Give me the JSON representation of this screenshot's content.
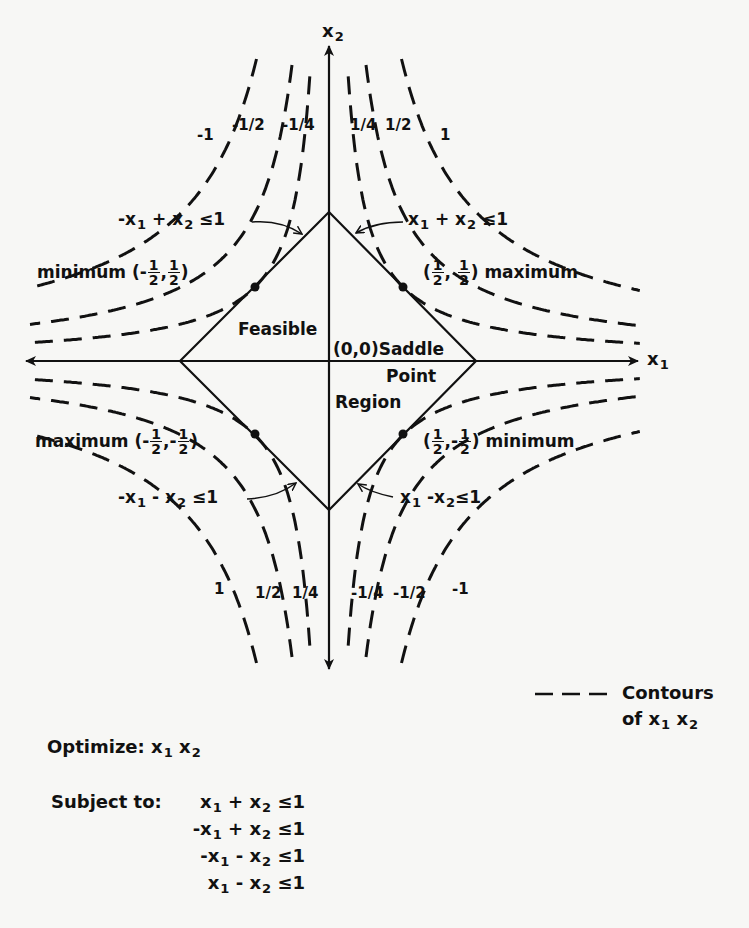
{
  "axes": {
    "x_label": "x",
    "x_label_sub": "1",
    "y_label": "x",
    "y_label_sub": "2"
  },
  "region": {
    "label_line1": "Feasible",
    "label_line2": "Region",
    "saddle_label": "(0,0)",
    "saddle_text1": "Saddle",
    "saddle_text2": "Point"
  },
  "constraints_on_plot": [
    {
      "id": "c_nw",
      "text": "-x",
      "sub1": "1",
      "mid": " + x",
      "sub2": "2",
      "rhs": " ≤1"
    },
    {
      "id": "c_ne",
      "text": "x",
      "sub1": "1",
      "mid": " + x",
      "sub2": "2",
      "rhs": " ≤1"
    },
    {
      "id": "c_sw",
      "text": "-x",
      "sub1": "1",
      "mid": " - x",
      "sub2": "2",
      "rhs": " ≤1"
    },
    {
      "id": "c_se",
      "text": "x",
      "sub1": "1",
      "mid": " -x",
      "sub2": "2",
      "rhs": "≤1"
    }
  ],
  "extrema": [
    {
      "id": "nw",
      "type": "minimum",
      "x_sign": "-",
      "x_num": "1",
      "x_den": "2",
      "y_sign": "",
      "y_num": "1",
      "y_den": "2"
    },
    {
      "id": "ne",
      "type": "maximum",
      "x_sign": "",
      "x_num": "1",
      "x_den": "2",
      "y_sign": "",
      "y_num": "1",
      "y_den": "2"
    },
    {
      "id": "sw",
      "type": "maximum",
      "x_sign": "-",
      "x_num": "1",
      "x_den": "2",
      "y_sign": "-",
      "y_num": "1",
      "y_den": "2"
    },
    {
      "id": "se",
      "type": "minimum",
      "x_sign": "",
      "x_num": "1",
      "x_den": "2",
      "y_sign": "-",
      "y_num": "1",
      "y_den": "2"
    }
  ],
  "contour_labels": {
    "top_left": [
      "-1",
      "-1/2",
      "-1/4"
    ],
    "top_right": [
      "1/4",
      "1/2",
      "1"
    ],
    "bottom_left": [
      "1",
      "1/2",
      "1/4"
    ],
    "bottom_right": [
      "-1/4",
      "-1/2",
      "-1"
    ]
  },
  "contour_values": [
    0.25,
    0.5,
    1
  ],
  "legend": {
    "line1": "Contours",
    "line2": "of x",
    "sub1": "1",
    "mid": "x",
    "sub2": "2"
  },
  "problem": {
    "optimize_label": "Optimize:",
    "objective": {
      "a": "x",
      "a_sub": "1",
      "b": "x",
      "b_sub": "2"
    },
    "subject_label": "Subject to:",
    "constraints": [
      {
        "s1": "",
        "v1": "x",
        "sub1": "1",
        "op": "+",
        "v2": "x",
        "sub2": "2",
        "rhs": "≤1"
      },
      {
        "s1": "-",
        "v1": "x",
        "sub1": "1",
        "op": "+",
        "v2": "x",
        "sub2": "2",
        "rhs": "≤1"
      },
      {
        "s1": "-",
        "v1": "x",
        "sub1": "1",
        "op": "-",
        "v2": "x",
        "sub2": "2",
        "rhs": "≤1"
      },
      {
        "s1": "",
        "v1": "x",
        "sub1": "1",
        "op": "-",
        "v2": "x",
        "sub2": "2",
        "rhs": "≤1"
      }
    ]
  },
  "colors": {
    "ink": "#111111",
    "paper": "#f7f7f5"
  }
}
